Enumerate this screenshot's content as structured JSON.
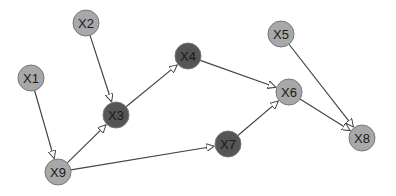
{
  "diagram": {
    "type": "directed-graph",
    "nodes": [
      {
        "id": "X1",
        "label": "X1",
        "x": 31,
        "y": 78,
        "fill": "#a8a8a8"
      },
      {
        "id": "X2",
        "label": "X2",
        "x": 86,
        "y": 23,
        "fill": "#a8a8a8"
      },
      {
        "id": "X3",
        "label": "X3",
        "x": 116,
        "y": 115,
        "fill": "#555555"
      },
      {
        "id": "X4",
        "label": "X4",
        "x": 188,
        "y": 56,
        "fill": "#555555"
      },
      {
        "id": "X5",
        "label": "X5",
        "x": 281,
        "y": 34,
        "fill": "#a8a8a8"
      },
      {
        "id": "X6",
        "label": "X6",
        "x": 289,
        "y": 92,
        "fill": "#a8a8a8"
      },
      {
        "id": "X7",
        "label": "X7",
        "x": 228,
        "y": 144,
        "fill": "#555555"
      },
      {
        "id": "X8",
        "label": "X8",
        "x": 362,
        "y": 138,
        "fill": "#a8a8a8"
      },
      {
        "id": "X9",
        "label": "X9",
        "x": 58,
        "y": 172,
        "fill": "#a8a8a8"
      }
    ],
    "edges": [
      {
        "from": "X1",
        "to": "X9"
      },
      {
        "from": "X2",
        "to": "X3"
      },
      {
        "from": "X9",
        "to": "X3"
      },
      {
        "from": "X3",
        "to": "X4"
      },
      {
        "from": "X4",
        "to": "X6"
      },
      {
        "from": "X9",
        "to": "X7"
      },
      {
        "from": "X7",
        "to": "X6"
      },
      {
        "from": "X6",
        "to": "X8"
      },
      {
        "from": "X5",
        "to": "X8"
      }
    ],
    "node_radius": 13,
    "edge_color": "#444444",
    "node_stroke": "#777777"
  }
}
